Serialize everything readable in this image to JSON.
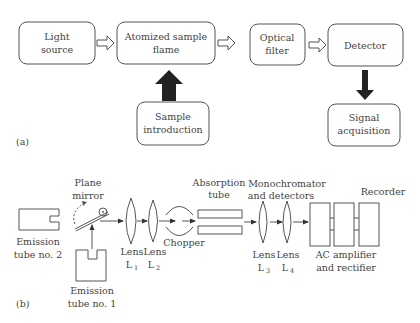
{
  "part_a": {
    "label": "(a)",
    "boxes": {
      "light_source": [
        "Light",
        "source"
      ],
      "atomized_flame": [
        "Atomized sample",
        "flame"
      ],
      "optical_filter": [
        "Optical",
        "filter"
      ],
      "detector": [
        "Detector"
      ],
      "sample_introduction": [
        "Sample",
        "introduction"
      ],
      "signal_acquisition": [
        "Signal",
        "acquisition"
      ]
    }
  },
  "part_b": {
    "label": "(b)",
    "labels": {
      "plane_mirror": [
        "Plane",
        "mirror"
      ],
      "emission_tube_2": [
        "Emission",
        "tube no. 2"
      ],
      "emission_tube_1": [
        "Emission",
        "tube no. 1"
      ],
      "lens1": {
        "name": "Lens",
        "symbol": "L",
        "sub": "1"
      },
      "lens2": {
        "name": "Lens",
        "symbol": "L",
        "sub": "2"
      },
      "lens3": {
        "name": "Lens",
        "symbol": "L",
        "sub": "3"
      },
      "lens4": {
        "name": "Lens",
        "symbol": "L",
        "sub": "4"
      },
      "chopper": "Chopper",
      "absorption_tube": [
        "Absorption",
        "tube"
      ],
      "monochromator": [
        "Monochromator",
        "and detectors"
      ],
      "recorder": "Recorder",
      "ac_amplifier": [
        "AC amplifier",
        "and rectifier"
      ]
    }
  }
}
